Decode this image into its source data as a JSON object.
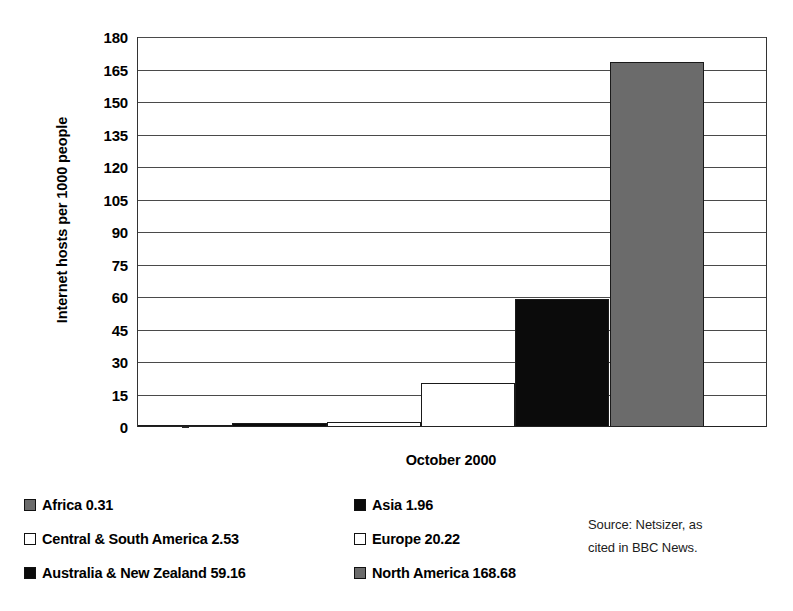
{
  "chart_data": {
    "type": "bar",
    "title": "",
    "xlabel": "October 2000",
    "ylabel": "Internet hosts per 1000 people",
    "ylim": [
      0,
      180
    ],
    "yticks": [
      0,
      15,
      30,
      45,
      60,
      75,
      90,
      105,
      120,
      135,
      150,
      165,
      180
    ],
    "ytick_labels": [
      "0",
      "15",
      "30",
      "45",
      "60",
      "75",
      "90",
      "105",
      "120",
      "135",
      "150",
      "165",
      "180"
    ],
    "grid": true,
    "legend_position": "bottom-left",
    "categories": [
      "Africa",
      "Asia",
      "Central & South America",
      "Europe",
      "Australia & New Zealand",
      "North America"
    ],
    "values": [
      0.31,
      1.96,
      2.53,
      20.22,
      59.16,
      168.68
    ],
    "series": [
      {
        "name": "October 2000",
        "values": [
          0.31,
          1.96,
          2.53,
          20.22,
          59.16,
          168.68
        ]
      }
    ],
    "bar_fills": [
      "gray",
      "black",
      "white",
      "white",
      "black",
      "gray"
    ],
    "bar_colors": [
      "#6b6b6b",
      "#0b0b0b",
      "#ffffff",
      "#ffffff",
      "#0b0b0b",
      "#6b6b6b"
    ],
    "annotations": [
      "Source: Netsizer, as cited in BBC News."
    ]
  },
  "axis": {
    "y_title": "Internet hosts per 1000 people",
    "x_title": "October 2000",
    "y_ticks": [
      "180",
      "165",
      "150",
      "135",
      "120",
      "105",
      "90",
      "75",
      "60",
      "45",
      "30",
      "15",
      "0"
    ]
  },
  "legend": {
    "entries": [
      {
        "label": "Africa 0.31",
        "swatch": "gray",
        "color": "#6b6b6b"
      },
      {
        "label": "Asia 1.96",
        "swatch": "black",
        "color": "#0b0b0b"
      },
      {
        "label": "Central & South America 2.53",
        "swatch": "white",
        "color": "#ffffff"
      },
      {
        "label": "Europe 20.22",
        "swatch": "white",
        "color": "#ffffff"
      },
      {
        "label": "Australia & New Zealand 59.16",
        "swatch": "black",
        "color": "#0b0b0b"
      },
      {
        "label": "North America 168.68",
        "swatch": "gray",
        "color": "#6b6b6b"
      }
    ]
  },
  "source": {
    "line1": "Source: Netsizer, as",
    "line2": "cited in BBC News."
  }
}
